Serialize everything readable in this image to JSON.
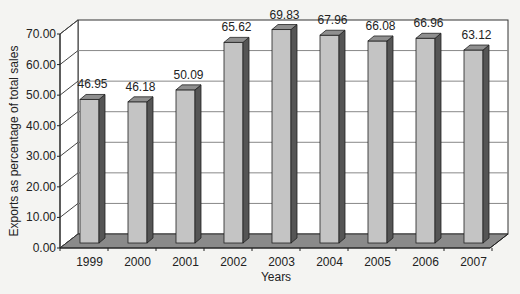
{
  "chart_data": {
    "type": "bar",
    "style": "3d-column",
    "title": "",
    "xlabel": "Years",
    "ylabel": "Exports as percentage of total sales",
    "categories": [
      "1999",
      "2000",
      "2001",
      "2002",
      "2003",
      "2004",
      "2005",
      "2006",
      "2007"
    ],
    "values": [
      46.95,
      46.18,
      50.09,
      65.62,
      69.83,
      67.96,
      66.08,
      66.96,
      63.12
    ],
    "data_labels": [
      "46.95",
      "46.18",
      "50.09",
      "65.62",
      "69.83",
      "67.96",
      "66.08",
      "66.96",
      "63.12"
    ],
    "ylim": [
      0,
      70
    ],
    "yticks": [
      "0.00",
      "10.00",
      "20.00",
      "30.00",
      "40.00",
      "50.00",
      "60.00",
      "70.00"
    ],
    "grid": true,
    "legend": null,
    "colors": {
      "bar_front": "#c4c4c4",
      "bar_side": "#555555",
      "bar_top": "#8f8f8f",
      "floor": "#8a8a8a",
      "wall": "#ffffff",
      "grid": "#888888",
      "background": "#f4f4f2"
    }
  }
}
